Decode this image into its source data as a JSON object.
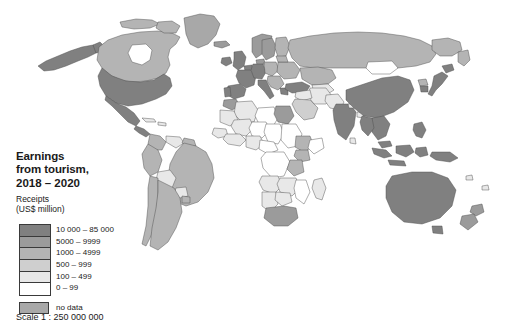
{
  "figure": {
    "kind": "world-choropleth-map",
    "background_color": "#ffffff"
  },
  "title": {
    "text": "Earnings\nfrom tourism,",
    "period": "2018 – 2020"
  },
  "legend": {
    "heading": "Receipts\n(US$ million)",
    "classes": [
      {
        "label": "10 000 – 85 000",
        "color": "#808080"
      },
      {
        "label": "5000 – 9999",
        "color": "#9b9b9b"
      },
      {
        "label": "1000 – 4999",
        "color": "#b4b4b4"
      },
      {
        "label": "500 – 999",
        "color": "#cfcfcf"
      },
      {
        "label": "100 – 499",
        "color": "#e8e8e8"
      },
      {
        "label": "0 – 99",
        "color": "#ffffff"
      }
    ],
    "no_data": {
      "label": "no data",
      "color": "#a8a8a8"
    }
  },
  "scale": {
    "text": "Scale 1 : 250 000 000"
  },
  "map_data": {
    "projection": "equal-area world",
    "ocean_color": "#ffffff",
    "border_color": "#4d4d4d",
    "regions": [
      {
        "name": "United States",
        "class": "10 000 – 85 000"
      },
      {
        "name": "Canada",
        "class": "1000 – 4999"
      },
      {
        "name": "Mexico",
        "class": "10 000 – 85 000"
      },
      {
        "name": "Greenland",
        "class": "no data"
      },
      {
        "name": "Brazil",
        "class": "1000 – 4999"
      },
      {
        "name": "Argentina",
        "class": "1000 – 4999"
      },
      {
        "name": "Bolivia",
        "class": "100 – 499"
      },
      {
        "name": "Paraguay",
        "class": "100 – 499"
      },
      {
        "name": "Chile",
        "class": "1000 – 4999"
      },
      {
        "name": "Peru",
        "class": "1000 – 4999"
      },
      {
        "name": "Colombia",
        "class": "1000 – 4999"
      },
      {
        "name": "Venezuela",
        "class": "100 – 499"
      },
      {
        "name": "United Kingdom",
        "class": "10 000 – 85 000"
      },
      {
        "name": "France",
        "class": "10 000 – 85 000"
      },
      {
        "name": "Spain",
        "class": "10 000 – 85 000"
      },
      {
        "name": "Portugal",
        "class": "10 000 – 85 000"
      },
      {
        "name": "Italy",
        "class": "10 000 – 85 000"
      },
      {
        "name": "Germany",
        "class": "10 000 – 85 000"
      },
      {
        "name": "Poland",
        "class": "5000 – 9999"
      },
      {
        "name": "Norway",
        "class": "5000 – 9999"
      },
      {
        "name": "Sweden",
        "class": "5000 – 9999"
      },
      {
        "name": "Finland",
        "class": "1000 – 4999"
      },
      {
        "name": "Russia",
        "class": "1000 – 4999"
      },
      {
        "name": "Turkey",
        "class": "10 000 – 85 000"
      },
      {
        "name": "Egypt",
        "class": "5000 – 9999"
      },
      {
        "name": "Morocco",
        "class": "5000 – 9999"
      },
      {
        "name": "Algeria",
        "class": "100 – 499"
      },
      {
        "name": "Libya",
        "class": "0 – 99"
      },
      {
        "name": "Sudan",
        "class": "0 – 99"
      },
      {
        "name": "Chad",
        "class": "0 – 99"
      },
      {
        "name": "Niger",
        "class": "0 – 99"
      },
      {
        "name": "Mali",
        "class": "100 – 499"
      },
      {
        "name": "Nigeria",
        "class": "100 – 499"
      },
      {
        "name": "Ethiopia",
        "class": "1000 – 4999"
      },
      {
        "name": "Kenya",
        "class": "1000 – 4999"
      },
      {
        "name": "Tanzania",
        "class": "1000 – 4999"
      },
      {
        "name": "South Africa",
        "class": "5000 – 9999"
      },
      {
        "name": "Namibia",
        "class": "100 – 499"
      },
      {
        "name": "Botswana",
        "class": "100 – 499"
      },
      {
        "name": "Madagascar",
        "class": "100 – 499"
      },
      {
        "name": "Saudi Arabia",
        "class": "500 – 999"
      },
      {
        "name": "India",
        "class": "10 000 – 85 000"
      },
      {
        "name": "China",
        "class": "10 000 – 85 000"
      },
      {
        "name": "Mongolia",
        "class": "0 – 99"
      },
      {
        "name": "Kazakhstan",
        "class": "1000 – 4999"
      },
      {
        "name": "Japan",
        "class": "10 000 – 85 000"
      },
      {
        "name": "South Korea",
        "class": "10 000 – 85 000"
      },
      {
        "name": "Thailand",
        "class": "10 000 – 85 000"
      },
      {
        "name": "Indonesia",
        "class": "10 000 – 85 000"
      },
      {
        "name": "Australia",
        "class": "10 000 – 85 000"
      },
      {
        "name": "New Zealand",
        "class": "5000 – 9999"
      }
    ]
  }
}
